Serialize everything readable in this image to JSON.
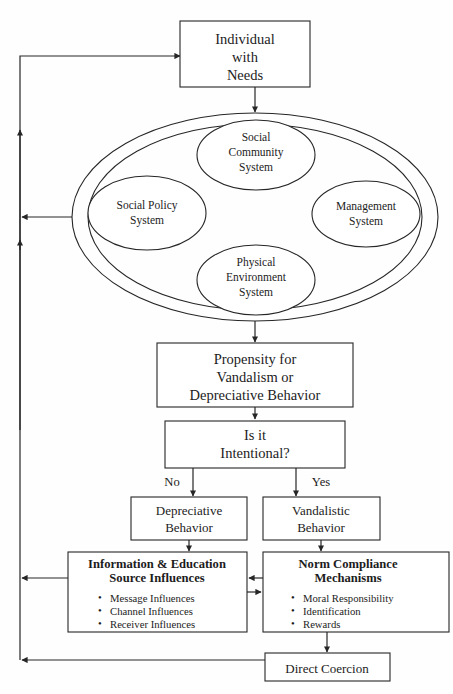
{
  "diagram": {
    "title_text": "Vandalism Behavior Model Flowchart",
    "colors": {
      "stroke": "#262626",
      "text": "#1c1c1c",
      "background": "#fefefe"
    },
    "nodes": {
      "individual": {
        "lines": [
          "Individual",
          "with",
          "Needs"
        ]
      },
      "social_community": {
        "lines": [
          "Social",
          "Community",
          "System"
        ]
      },
      "social_policy": {
        "lines": [
          "Social Policy",
          "System"
        ]
      },
      "management": {
        "lines": [
          "Management",
          "System"
        ]
      },
      "physical_environment": {
        "lines": [
          "Physical",
          "Environment",
          "System"
        ]
      },
      "propensity": {
        "lines": [
          "Propensity for",
          "Vandalism or",
          "Depreciative Behavior"
        ]
      },
      "intentional": {
        "lines": [
          "Is it",
          "Intentional?"
        ]
      },
      "depreciative": {
        "lines": [
          "Depreciative",
          "Behavior"
        ]
      },
      "vandalistic": {
        "lines": [
          "Vandalistic",
          "Behavior"
        ]
      },
      "information_education": {
        "heading": [
          "Information & Education",
          "Source Influences"
        ],
        "bullets": [
          "Message Influences",
          "Channel Influences",
          "Receiver Influences"
        ]
      },
      "norm_compliance": {
        "heading": [
          "Norm Compliance",
          "Mechanisms"
        ],
        "bullets": [
          "Moral Responsibility",
          "Identification",
          "Rewards"
        ]
      },
      "direct_coercion": {
        "lines": [
          "Direct Coercion"
        ]
      }
    },
    "edge_labels": {
      "no": "No",
      "yes": "Yes"
    },
    "bullet_glyph": "•"
  }
}
